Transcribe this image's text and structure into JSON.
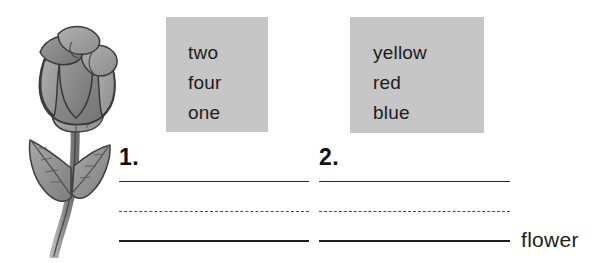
{
  "page": {
    "background_color": "#ffffff",
    "word_box_color": "#c6c6c6",
    "ink_color": "#1c1c1c"
  },
  "illustration": {
    "name": "rose-flower-drawing",
    "alt_label": "rose",
    "petal_color": "#8c8c8c",
    "petal_shadow_color": "#6e6e6e",
    "leaf_color": "#9a9a9a",
    "outline_color": "#3a3a3a"
  },
  "word_boxes": [
    {
      "id": "word-box-1",
      "words": [
        "two",
        "four",
        "one"
      ]
    },
    {
      "id": "word-box-2",
      "words": [
        "yellow",
        "red",
        "blue"
      ]
    }
  ],
  "answers": [
    {
      "number": "1."
    },
    {
      "number": "2."
    }
  ],
  "trailing_word": "flower"
}
